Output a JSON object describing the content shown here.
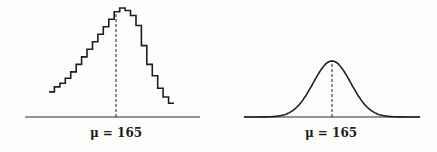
{
  "chart_data": [
    {
      "type": "line",
      "style": "step",
      "title": "",
      "xlabel": "μ = 165",
      "ylabel": "",
      "grid": false,
      "mean": 165,
      "mean_label": "μ = 165",
      "x_range": [
        142,
        188
      ],
      "y_range": [
        0,
        1
      ],
      "x": [
        142,
        144,
        146,
        148,
        150,
        152,
        154,
        156,
        158,
        160,
        162,
        164,
        166,
        168,
        170,
        172,
        174,
        176,
        178,
        180,
        182,
        184,
        186
      ],
      "values": [
        0.2,
        0.24,
        0.27,
        0.31,
        0.36,
        0.42,
        0.48,
        0.54,
        0.6,
        0.66,
        0.72,
        0.78,
        0.84,
        0.87,
        0.85,
        0.81,
        0.73,
        0.57,
        0.42,
        0.33,
        0.23,
        0.16,
        0.11
      ]
    },
    {
      "type": "line",
      "style": "smooth",
      "title": "",
      "xlabel": "μ = 165",
      "ylabel": "",
      "grid": false,
      "distribution": "normal",
      "mean": 165,
      "mean_label": "μ = 165",
      "x_range": [
        130,
        200
      ],
      "peak_relative_height": 0.5
    }
  ]
}
